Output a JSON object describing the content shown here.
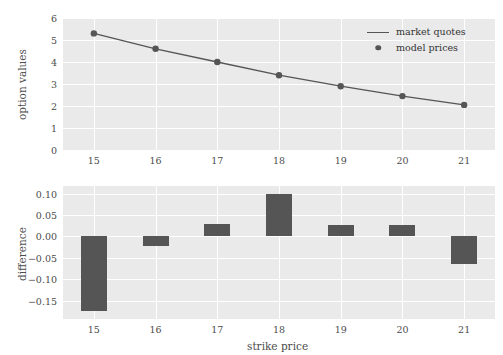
{
  "chart_data": [
    {
      "type": "line",
      "title": "",
      "xlabel": "",
      "ylabel": "option values",
      "categories": [
        15,
        16,
        17,
        18,
        19,
        20,
        21
      ],
      "x": [
        15,
        16,
        17,
        18,
        19,
        20,
        21
      ],
      "xlim": [
        14.5,
        21.5
      ],
      "ylim": [
        0,
        6
      ],
      "xticks": [
        "15",
        "16",
        "17",
        "18",
        "19",
        "20",
        "21"
      ],
      "yticks": [
        "0",
        "1",
        "2",
        "3",
        "4",
        "5",
        "6"
      ],
      "grid": true,
      "legend_position": "upper right",
      "series": [
        {
          "name": "market quotes",
          "marker": "line",
          "color": "#555555",
          "values": [
            5.3,
            4.6,
            4.0,
            3.4,
            2.9,
            2.45,
            2.05
          ]
        },
        {
          "name": "model prices",
          "marker": "dot",
          "color": "#555555",
          "values": [
            5.3,
            4.6,
            4.0,
            3.4,
            2.9,
            2.45,
            2.05
          ]
        }
      ]
    },
    {
      "type": "bar",
      "title": "",
      "xlabel": "strike price",
      "ylabel": "difference",
      "categories": [
        15,
        16,
        17,
        18,
        19,
        20,
        21
      ],
      "values": [
        -0.175,
        -0.022,
        0.028,
        0.1,
        0.027,
        0.027,
        -0.065
      ],
      "xlim": [
        14.5,
        21.5
      ],
      "ylim": [
        -0.193,
        0.118
      ],
      "xticks": [
        "15",
        "16",
        "17",
        "18",
        "19",
        "20",
        "21"
      ],
      "yticks": [
        "0.10",
        "0.05",
        "0.00",
        "−0.05",
        "−0.10",
        "−0.15"
      ],
      "ytick_values": [
        0.1,
        0.05,
        0.0,
        -0.05,
        -0.1,
        -0.15
      ],
      "grid": true,
      "bar_color": "#555555"
    }
  ],
  "style": {
    "panel_background": "#eaeaea",
    "grid_color": "#ffffff",
    "figure_background": "#ffffff",
    "mark_color": "#555555",
    "text_color": "#4c4c4c"
  },
  "legend": {
    "items": [
      {
        "label": "market quotes",
        "key": "line"
      },
      {
        "label": "model prices",
        "key": "dot"
      }
    ]
  }
}
